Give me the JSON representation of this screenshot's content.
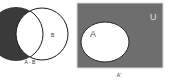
{
  "diagrams": [
    {
      "caption": "A - B",
      "set_b_label": "B",
      "shaded_region": "A minus B",
      "colors": {
        "shade": "#3a3a3a",
        "outline": "#1a1a1a"
      }
    },
    {
      "caption": "A'",
      "set_a_label": "A",
      "universe_label": "U",
      "shaded_region": "complement of A",
      "colors": {
        "shade": "#6e6e6e",
        "border": "#d8d8d8",
        "inner": "#ffffff"
      }
    }
  ]
}
